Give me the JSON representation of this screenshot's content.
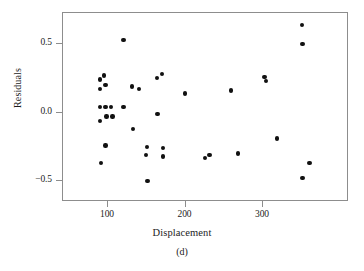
{
  "figure": {
    "panel_caption": "(d)",
    "point_color": "#111111",
    "frame_color": "#8d8d8d"
  },
  "chart_data": {
    "type": "scatter",
    "title": "",
    "subtitle": "",
    "xlabel": "Displacement",
    "ylabel": "Residuals",
    "xlim": [
      50,
      419
    ],
    "ylim": [
      -0.63,
      0.71
    ],
    "grid": false,
    "legend": null,
    "xticks": [
      100,
      200,
      300
    ],
    "xtick_labels": [
      "100",
      "200",
      "300"
    ],
    "yticks": [
      0.5,
      0.0,
      -0.5
    ],
    "ytick_labels": [
      "0.5",
      "0.0",
      "-0.5"
    ],
    "series": [
      {
        "name": "residuals",
        "marker": "filled-circle",
        "color": "#111111",
        "points": [
          {
            "x": 90,
            "y": 0.24
          },
          {
            "x": 90,
            "y": 0.17
          },
          {
            "x": 90,
            "y": 0.04
          },
          {
            "x": 90,
            "y": -0.06
          },
          {
            "x": 91,
            "y": -0.37
          },
          {
            "x": 95,
            "y": 0.27
          },
          {
            "x": 97,
            "y": 0.2
          },
          {
            "x": 97,
            "y": 0.04
          },
          {
            "x": 98,
            "y": -0.03
          },
          {
            "x": 97,
            "y": -0.24
          },
          {
            "x": 104,
            "y": 0.04
          },
          {
            "x": 106,
            "y": -0.03
          },
          {
            "x": 120,
            "y": 0.53
          },
          {
            "x": 120,
            "y": 0.04
          },
          {
            "x": 131,
            "y": 0.19
          },
          {
            "x": 132,
            "y": -0.12
          },
          {
            "x": 140,
            "y": 0.17
          },
          {
            "x": 150,
            "y": -0.25
          },
          {
            "x": 149,
            "y": -0.31
          },
          {
            "x": 151,
            "y": -0.5
          },
          {
            "x": 163,
            "y": 0.25
          },
          {
            "x": 164,
            "y": -0.01
          },
          {
            "x": 170,
            "y": 0.28
          },
          {
            "x": 171,
            "y": -0.26
          },
          {
            "x": 171,
            "y": -0.32
          },
          {
            "x": 199,
            "y": 0.14
          },
          {
            "x": 225,
            "y": -0.33
          },
          {
            "x": 231,
            "y": -0.31
          },
          {
            "x": 259,
            "y": 0.16
          },
          {
            "x": 268,
            "y": -0.3
          },
          {
            "x": 302,
            "y": 0.26
          },
          {
            "x": 304,
            "y": 0.23
          },
          {
            "x": 318,
            "y": -0.19
          },
          {
            "x": 350,
            "y": 0.64
          },
          {
            "x": 351,
            "y": 0.5
          },
          {
            "x": 351,
            "y": -0.48
          },
          {
            "x": 360,
            "y": -0.37
          }
        ]
      }
    ]
  }
}
